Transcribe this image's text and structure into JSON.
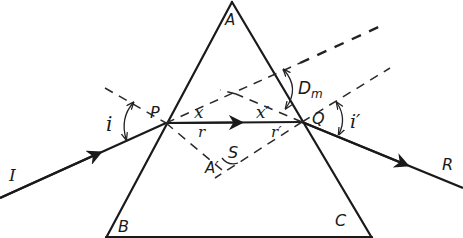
{
  "diagram": {
    "labels": {
      "apex": "A",
      "base_left": "B",
      "base_right": "C",
      "entry_point": "P",
      "exit_point": "Q",
      "incident_ray": "I",
      "emergent_ray": "R",
      "angle_incidence": "i",
      "angle_emergence": "i′",
      "angle_refraction_entry": "r",
      "angle_refraction_exit": "r′",
      "angle_x": "x",
      "angle_x_prime": "x′",
      "deviation": "D",
      "deviation_subscript": "m",
      "normals_intersection": "A′",
      "angle_s": "S"
    },
    "colors": {
      "line": "#1a1a1a",
      "background": "#ffffff"
    }
  }
}
